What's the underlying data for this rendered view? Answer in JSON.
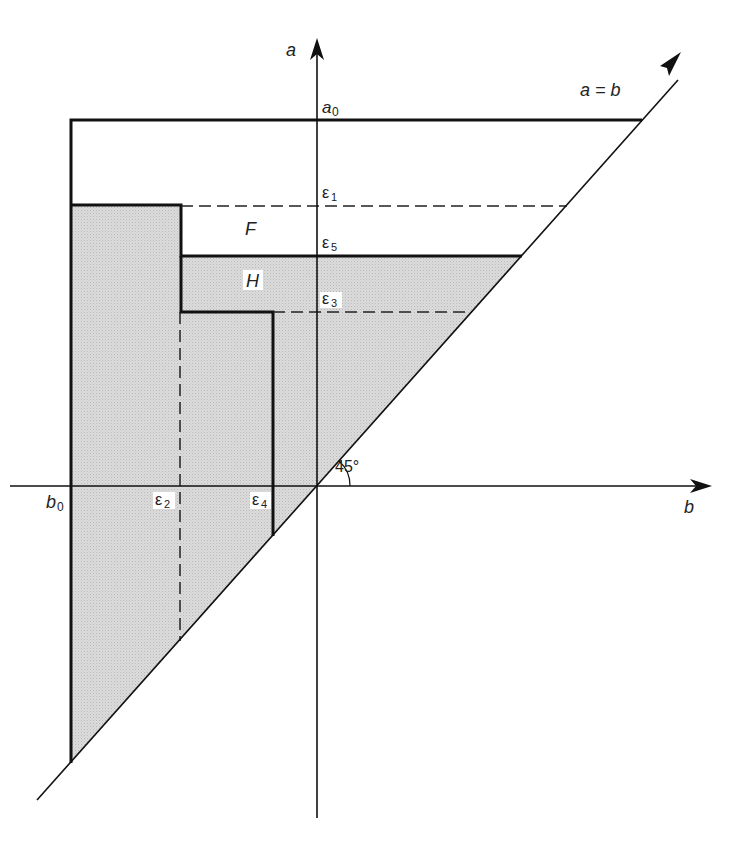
{
  "diagram": {
    "axes": {
      "vertical_label": "a",
      "horizontal_label": "b",
      "diagonal_label": "a = b",
      "angle_label": "45°"
    },
    "levels": {
      "a0": {
        "sym": "a",
        "sub": "0"
      },
      "e1": {
        "sym": "ε",
        "sub": "1"
      },
      "e5": {
        "sym": "ε",
        "sub": "5"
      },
      "e3": {
        "sym": "ε",
        "sub": "3"
      },
      "b0": {
        "sym": "b",
        "sub": "0"
      },
      "e2": {
        "sym": "ε",
        "sub": "2"
      },
      "e4": {
        "sym": "ε",
        "sub": "4"
      }
    },
    "regions": {
      "F": "F",
      "H": "H"
    },
    "colors": {
      "line": "#111111",
      "fill": "#d6d6d6",
      "text": "#222222"
    }
  }
}
